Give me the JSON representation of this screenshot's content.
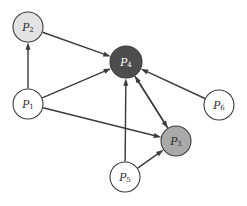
{
  "figure": {
    "name": "directed-influence-graph",
    "background_color": "#ffffff",
    "width": 247,
    "height": 206
  },
  "chart_data": {
    "type": "diagram",
    "subtype": "directed-graph",
    "title": "",
    "xlabel": "",
    "ylabel": "",
    "grid": false,
    "legend": "none",
    "node_radius": 15,
    "nodes": [
      {
        "id": "P2",
        "label": "P",
        "subscript": "2",
        "label_full": "P2",
        "x": 28,
        "y": 27,
        "r": 15,
        "fill": "#e3e3e3",
        "stroke": "#3c3c3c",
        "text_color": "#2b2b2b"
      },
      {
        "id": "P4",
        "label": "P",
        "subscript": "4",
        "label_full": "P4",
        "x": 126,
        "y": 62,
        "r": 16,
        "fill": "#4d4d4d",
        "stroke": "#3c3c3c",
        "text_color": "#ffffff"
      },
      {
        "id": "P1",
        "label": "P",
        "subscript": "1",
        "label_full": "P1",
        "x": 28,
        "y": 104,
        "r": 15,
        "fill": "#ffffff",
        "stroke": "#3c3c3c",
        "text_color": "#2b2b2b"
      },
      {
        "id": "P6",
        "label": "P",
        "subscript": "6",
        "label_full": "P6",
        "x": 219,
        "y": 105,
        "r": 15,
        "fill": "#ffffff",
        "stroke": "#3c3c3c",
        "text_color": "#2b2b2b"
      },
      {
        "id": "P3",
        "label": "P",
        "subscript": "3",
        "label_full": "P3",
        "x": 176,
        "y": 141,
        "r": 15,
        "fill": "#a9a9a9",
        "stroke": "#3c3c3c",
        "text_color": "#2b2b2b"
      },
      {
        "id": "P5",
        "label": "P",
        "subscript": "5",
        "label_full": "P5",
        "x": 125,
        "y": 177,
        "r": 15,
        "fill": "#ffffff",
        "stroke": "#3c3c3c",
        "text_color": "#2b2b2b"
      }
    ],
    "edges": [
      {
        "from": "P1",
        "to": "P2",
        "directed": true
      },
      {
        "from": "P2",
        "to": "P4",
        "directed": true
      },
      {
        "from": "P1",
        "to": "P4",
        "directed": true
      },
      {
        "from": "P1",
        "to": "P3",
        "directed": true
      },
      {
        "from": "P6",
        "to": "P4",
        "directed": true
      },
      {
        "from": "P5",
        "to": "P4",
        "directed": true
      },
      {
        "from": "P5",
        "to": "P3",
        "directed": true
      },
      {
        "from": "P3",
        "to": "P4",
        "directed": true
      },
      {
        "from": "P4",
        "to": "P3",
        "directed": true
      }
    ],
    "edge_color": "#3c3c3c",
    "edge_width": 1.45,
    "arrow_size": 6
  }
}
